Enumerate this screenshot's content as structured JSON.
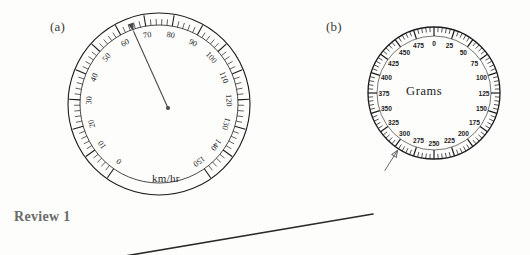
{
  "page": {
    "background_color": "#fdfdfc",
    "ink_color": "#1c1c1c",
    "caption_color": "#6b6b6b"
  },
  "figures": [
    {
      "id": "speedometer",
      "label": "(a)",
      "unit_label": "km/hr"
    },
    {
      "id": "scale-dial",
      "label": "(b)",
      "center_label": "Grams"
    }
  ],
  "labels": {
    "fig_a": "(a)",
    "fig_b": "(b)",
    "km_hr": "km/hr",
    "grams": "Grams",
    "review": "Review 1"
  },
  "chart_data": [
    {
      "type": "gauge",
      "id": "speedometer",
      "title": "(a)",
      "unit": "km/hr",
      "center_label": "km/hr",
      "min": 0,
      "max": 150,
      "major_step": 10,
      "minor_step": 2,
      "tick_labels": [
        0,
        10,
        20,
        30,
        40,
        50,
        60,
        70,
        80,
        90,
        100,
        110,
        120,
        130,
        140,
        150
      ],
      "start_angle_deg": 215,
      "sweep_deg": 290,
      "needle_value": 65,
      "needle_style": "arrow",
      "annotation": "needle points between 60 and 70",
      "geometry": {
        "cx": 159,
        "cy": 104,
        "r_outer": 91,
        "r_inner": 79
      }
    },
    {
      "type": "gauge",
      "id": "scale-dial",
      "title": "(b)",
      "unit": "Grams",
      "center_label": "Grams",
      "min": 0,
      "max": 500,
      "major_step": 25,
      "minor_step": 5,
      "tick_labels": [
        0,
        25,
        50,
        75,
        100,
        125,
        150,
        175,
        200,
        225,
        250,
        275,
        300,
        325,
        350,
        375,
        400,
        425,
        450,
        475
      ],
      "start_angle_deg": 0,
      "sweep_deg": 360,
      "pointer_value": 295,
      "pointer_style": "external-arrow",
      "annotation": "arrow points from lower-left toward the dial rim near 295 grams",
      "geometry": {
        "cx": 434,
        "cy": 93,
        "r_outer": 66,
        "r_inner": 57
      }
    }
  ],
  "decorations": {
    "diagonal_rule": {
      "x1": 125,
      "y1": 256,
      "x2": 373,
      "y2": 214,
      "color": "#2a2a2a"
    }
  }
}
